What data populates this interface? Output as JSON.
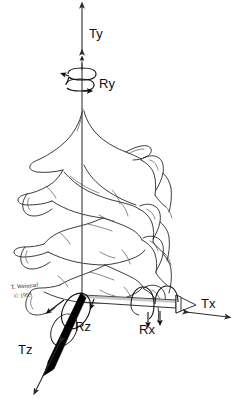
{
  "figure": {
    "background_color": "#ffffff",
    "line_color": "#1a1a1a",
    "axis_color": "#4a4a4a"
  },
  "labels": {
    "ty": "Ty",
    "ry": "Ry",
    "tx": "Tx",
    "rx": "Rx",
    "tz": "Tz",
    "rz": "Rz"
  },
  "signature": {
    "name": "T. Weinzarl",
    "copyright": "© 1993"
  },
  "anatomy": {
    "subject": "cervical vertebrae",
    "view": "posterior oblique"
  }
}
